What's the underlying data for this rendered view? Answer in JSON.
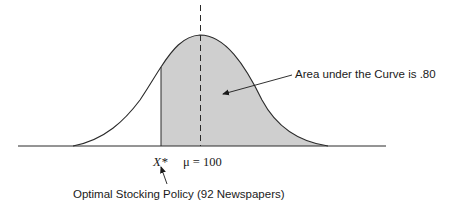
{
  "diagram": {
    "type": "normal-distribution",
    "labels": {
      "x_star": "X*",
      "mean": "μ = 100",
      "area_annotation": "Area under the Curve is .80",
      "policy_annotation": "Optimal Stocking Policy (92 Newspapers)"
    },
    "values": {
      "mean": 100,
      "optimal_stock": 92,
      "shaded_area": 0.8
    },
    "colors": {
      "shade": "#cfcfcf",
      "line": "#2a2a2a",
      "background": "#ffffff"
    }
  }
}
